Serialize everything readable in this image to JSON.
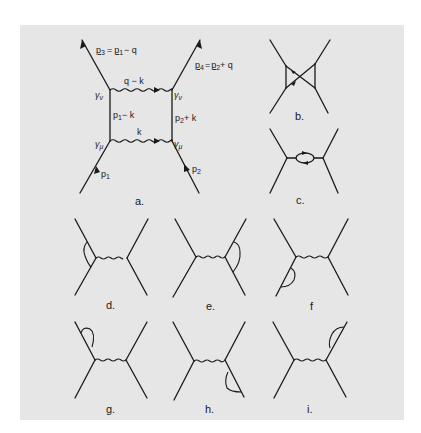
{
  "figure": {
    "background": "#e6e6e6",
    "ink": "#1a1a1a",
    "panels": [
      {
        "id": "a",
        "label": "a.",
        "label_pos": [
          140,
          204
        ],
        "type": "box-diagram",
        "box": {
          "x1": 110,
          "y1": 90,
          "x2": 172,
          "y2": 141
        },
        "legs": [
          {
            "from": [
              110,
              90
            ],
            "to": [
              82,
              40
            ],
            "arrow": "out",
            "name": "p3"
          },
          {
            "from": [
              172,
              90
            ],
            "to": [
              200,
              40
            ],
            "arrow": "out",
            "name": "p4"
          },
          {
            "from": [
              80,
              193
            ],
            "to": [
              110,
              141
            ],
            "arrow": "in",
            "name": "p1"
          },
          {
            "from": [
              199,
              193
            ],
            "to": [
              172,
              141
            ],
            "arrow": "in",
            "name": "p2"
          }
        ],
        "annotations": {
          "p3_eq": "p3 = p1 − q",
          "p4_eq": "p4 = p2 + q",
          "top_photon": "q − k",
          "bottom_photon": "k",
          "left_fermion": "p1 − k",
          "right_fermion": "p2 + k",
          "p1": "p1",
          "p2": "p2",
          "gamma_nu": "γν",
          "gamma_mu": "γμ"
        }
      },
      {
        "id": "b",
        "label": "b.",
        "label_pos": [
          300,
          120
        ],
        "type": "crossed-box"
      },
      {
        "id": "c",
        "label": "c.",
        "label_pos": [
          300,
          204
        ],
        "type": "vacuum-polarization"
      },
      {
        "id": "d",
        "label": "d.",
        "label_pos": [
          110,
          308
        ],
        "type": "vertex-correction-left"
      },
      {
        "id": "e",
        "label": "e.",
        "label_pos": [
          211,
          308
        ],
        "type": "vertex-correction-right"
      },
      {
        "id": "f",
        "label": "f",
        "label_pos": [
          313,
          308
        ],
        "type": "self-energy-lower-left"
      },
      {
        "id": "g",
        "label": "g.",
        "label_pos": [
          110,
          412
        ],
        "type": "self-energy-upper-left"
      },
      {
        "id": "h",
        "label": "h.",
        "label_pos": [
          210,
          412
        ],
        "type": "self-energy-lower-right"
      },
      {
        "id": "i",
        "label": "i.",
        "label_pos": [
          311,
          412
        ],
        "type": "self-energy-upper-right"
      }
    ]
  },
  "labels": {
    "a": "a.",
    "b": "b.",
    "c": "c.",
    "d": "d.",
    "e": "e.",
    "f": "f",
    "g": "g.",
    "h": "h.",
    "i": "i."
  },
  "box_text": {
    "p3": "p",
    "p3_sub": "3",
    "eq1": "=",
    "p1a": "p",
    "p1a_sub": "1",
    "minus_q": "− q",
    "p4": "p",
    "p4_sub": "4",
    "eq2": "=",
    "p2a": "p",
    "p2a_sub": "2",
    "plus_q": "+ q",
    "q_minus_k": "q − k",
    "k": "k",
    "p1_minus": "p",
    "p1_minus_sub": "1",
    "minus_k": "− k",
    "p2_plus": "p",
    "p2_plus_sub": "2",
    "plus_k": "+ k",
    "p1": "p",
    "p1_sub": "1",
    "p2": "p",
    "p2_sub": "2",
    "gamma": "γ",
    "nu": "ν",
    "mu": "μ"
  }
}
